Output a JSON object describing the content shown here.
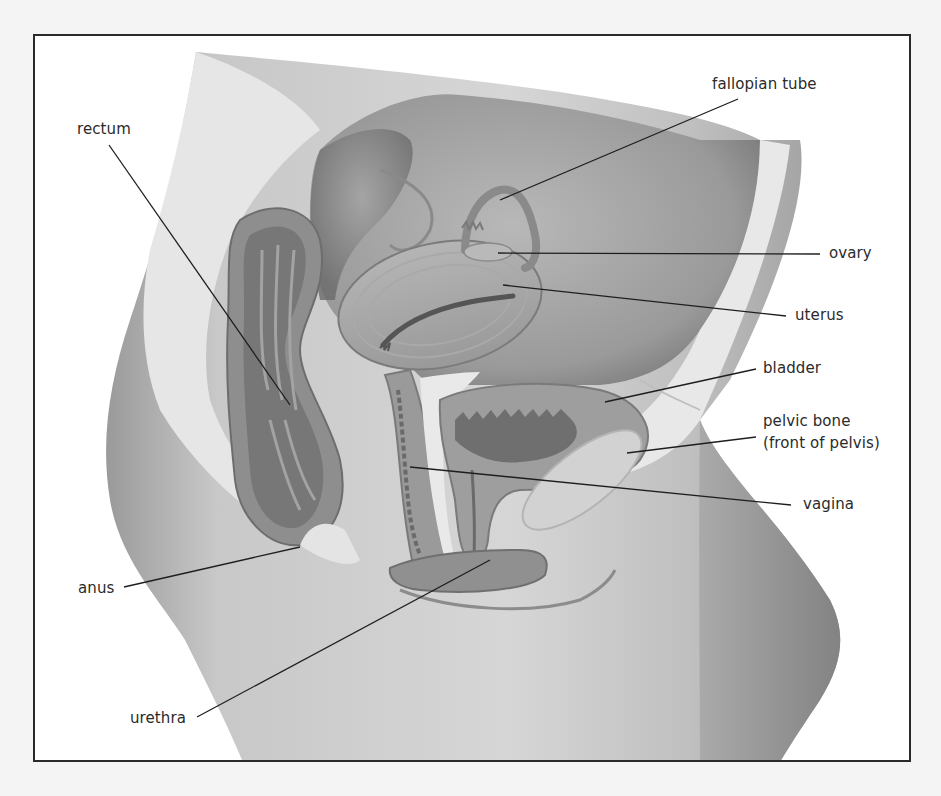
{
  "diagram": {
    "title": "",
    "labels": [
      {
        "id": "fallopian-tube",
        "text": "fallopian tube",
        "x": 712,
        "y": 74
      },
      {
        "id": "rectum",
        "text": "rectum",
        "x": 77,
        "y": 119
      },
      {
        "id": "ovary",
        "text": "ovary",
        "x": 829,
        "y": 243
      },
      {
        "id": "uterus",
        "text": "uterus",
        "x": 795,
        "y": 305
      },
      {
        "id": "bladder",
        "text": "bladder",
        "x": 763,
        "y": 358
      },
      {
        "id": "pelvic-bone",
        "text": "pelvic bone",
        "x": 763,
        "y": 411
      },
      {
        "id": "pelvic-bone-sub",
        "text": "(front of pelvis)",
        "x": 763,
        "y": 433
      },
      {
        "id": "vagina",
        "text": "vagina",
        "x": 803,
        "y": 494
      },
      {
        "id": "anus",
        "text": "anus",
        "x": 78,
        "y": 578
      },
      {
        "id": "urethra",
        "text": "urethra",
        "x": 130,
        "y": 708
      }
    ],
    "leader_lines": [
      {
        "label": "fallopian tube",
        "x1": 738,
        "y1": 99,
        "x2": 500,
        "y2": 200
      },
      {
        "label": "rectum",
        "x1": 109,
        "y1": 145,
        "x2": 290,
        "y2": 405
      },
      {
        "label": "ovary",
        "x1": 820,
        "y1": 254,
        "x2": 498,
        "y2": 253
      },
      {
        "label": "uterus",
        "x1": 786,
        "y1": 316,
        "x2": 503,
        "y2": 285
      },
      {
        "label": "bladder",
        "x1": 756,
        "y1": 369,
        "x2": 605,
        "y2": 402
      },
      {
        "label": "pelvic bone",
        "x1": 756,
        "y1": 437,
        "x2": 627,
        "y2": 453
      },
      {
        "label": "vagina",
        "x1": 791,
        "y1": 505,
        "x2": 410,
        "y2": 467
      },
      {
        "label": "anus",
        "x1": 124,
        "y1": 587,
        "x2": 300,
        "y2": 547
      },
      {
        "label": "urethra",
        "x1": 197,
        "y1": 717,
        "x2": 490,
        "y2": 560
      }
    ],
    "colors": {
      "background": "#f4f4f4",
      "frame_fill": "#ffffff",
      "frame_border": "#2a2a2a",
      "label_text": "#2b2b2b",
      "leader_line": "#1e1e1e"
    }
  }
}
